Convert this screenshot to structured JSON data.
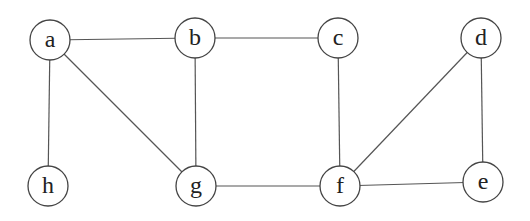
{
  "graph": {
    "nodes": [
      {
        "id": "a",
        "label": "a",
        "x": 50,
        "y": 40
      },
      {
        "id": "b",
        "label": "b",
        "x": 195,
        "y": 38
      },
      {
        "id": "c",
        "label": "c",
        "x": 338,
        "y": 38
      },
      {
        "id": "d",
        "label": "d",
        "x": 481,
        "y": 38
      },
      {
        "id": "h",
        "label": "h",
        "x": 48,
        "y": 186
      },
      {
        "id": "g",
        "label": "g",
        "x": 196,
        "y": 186
      },
      {
        "id": "f",
        "label": "f",
        "x": 340,
        "y": 186
      },
      {
        "id": "e",
        "label": "e",
        "x": 483,
        "y": 182
      }
    ],
    "edges": [
      {
        "from": "a",
        "to": "b"
      },
      {
        "from": "b",
        "to": "c"
      },
      {
        "from": "a",
        "to": "h"
      },
      {
        "from": "a",
        "to": "g"
      },
      {
        "from": "b",
        "to": "g"
      },
      {
        "from": "c",
        "to": "f"
      },
      {
        "from": "g",
        "to": "f"
      },
      {
        "from": "f",
        "to": "d"
      },
      {
        "from": "f",
        "to": "e"
      },
      {
        "from": "d",
        "to": "e"
      }
    ],
    "node_radius": 20,
    "colors": {
      "edge": "#555555",
      "node_stroke": "#444444",
      "label": "#222222",
      "background": "#ffffff"
    }
  }
}
